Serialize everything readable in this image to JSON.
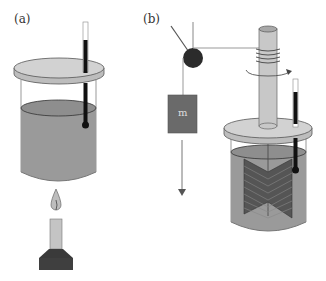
{
  "panels": [
    {
      "id": "a",
      "label": "(a)",
      "description": "Beaker of liquid with thermometer heated by a flame"
    },
    {
      "id": "b",
      "label": "(b)",
      "description": "Joule apparatus: falling mass turns paddle wheel via pulley and string"
    }
  ],
  "mass_label": "m",
  "colors": {
    "liquid": "#9a9a9a",
    "lid": "#cfcfcf",
    "dark": "#2b2b2b",
    "mass": "#6a6a6a",
    "paddle": "#555555",
    "rod": "#c8c8c8"
  }
}
